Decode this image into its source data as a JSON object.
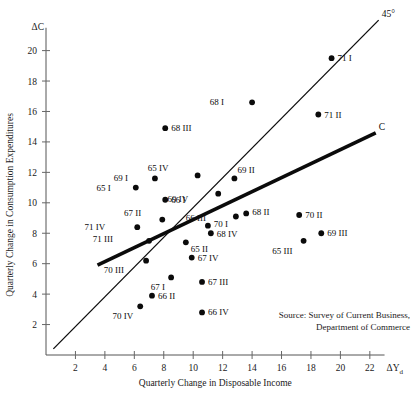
{
  "chart_data": {
    "type": "scatter",
    "title": "",
    "xlabel": "Quarterly Change in Disposable Income",
    "ylabel": "Quarterly Change in Consumption Expenditures",
    "x_symbol": "ΔY",
    "x_symbol_sub": "d",
    "y_symbol": "ΔC",
    "xlim": [
      0,
      23
    ],
    "ylim": [
      0,
      21.5
    ],
    "xticks": [
      2,
      4,
      6,
      8,
      10,
      12,
      14,
      16,
      18,
      20,
      22
    ],
    "yticks": [
      2,
      4,
      6,
      8,
      10,
      12,
      14,
      16,
      18,
      20
    ],
    "grid": false,
    "legend": "none",
    "series": [
      {
        "name": "Quarterly observations",
        "marker": "filled-circle",
        "color": "#0b0b0b",
        "points": [
          {
            "label": "68 III",
            "x": 8.1,
            "y": 14.9,
            "lx": 6,
            "ly": 3
          },
          {
            "label": "71 I",
            "x": 19.4,
            "y": 19.5,
            "lx": 6,
            "ly": 3
          },
          {
            "label": "68 I",
            "x": 14.0,
            "y": 16.6,
            "lx": -28,
            "ly": 3
          },
          {
            "label": "71 II",
            "x": 18.5,
            "y": 15.8,
            "lx": 6,
            "ly": 3
          },
          {
            "label": "69 I",
            "x": 7.4,
            "y": 11.6,
            "lx": -27,
            "ly": 3
          },
          {
            "label": "65 I",
            "x": 6.1,
            "y": 11.0,
            "lx": -25,
            "ly": 3
          },
          {
            "label": "65 IV",
            "x": 10.3,
            "y": 11.8,
            "lx": -29,
            "ly": -4
          },
          {
            "label": "69 II",
            "x": 12.8,
            "y": 11.6,
            "lx": 3,
            "ly": -5
          },
          {
            "label": "66 I",
            "x": 8.1,
            "y": 10.2,
            "lx": 6,
            "ly": 3
          },
          {
            "label": "69 IV",
            "x": 11.7,
            "y": 10.6,
            "lx": -30,
            "ly": 8
          },
          {
            "label": "67 II",
            "x": 7.9,
            "y": 8.9,
            "lx": -21,
            "ly": -4
          },
          {
            "label": "68 II",
            "x": 13.6,
            "y": 9.3,
            "lx": 6,
            "ly": 2
          },
          {
            "label": "70 I",
            "x": 12.9,
            "y": 9.1,
            "lx": -8,
            "ly": 11
          },
          {
            "label": "70 II",
            "x": 17.2,
            "y": 9.2,
            "lx": 6,
            "ly": 3
          },
          {
            "label": "71 IV",
            "x": 6.2,
            "y": 8.4,
            "lx": -32,
            "ly": 3
          },
          {
            "label": "66 III",
            "x": 11.0,
            "y": 8.5,
            "lx": -2,
            "ly": -5
          },
          {
            "label": "68 IV",
            "x": 11.2,
            "y": 8.0,
            "lx": 6,
            "ly": 4
          },
          {
            "label": "71 III",
            "x": 7.0,
            "y": 7.5,
            "lx": -36,
            "ly": 1
          },
          {
            "label": "69 III",
            "x": 18.7,
            "y": 8.0,
            "lx": 6,
            "ly": 3
          },
          {
            "label": "65 II",
            "x": 9.5,
            "y": 7.4,
            "lx": 5,
            "ly": 10
          },
          {
            "label": "65 III",
            "x": 17.5,
            "y": 7.5,
            "lx": -11,
            "ly": 13
          },
          {
            "label": "70 III",
            "x": 6.8,
            "y": 6.2,
            "lx": -22,
            "ly": 12
          },
          {
            "label": "67 IV",
            "x": 9.9,
            "y": 6.4,
            "lx": 6,
            "ly": 3
          },
          {
            "label": "67 I",
            "x": 8.5,
            "y": 5.1,
            "lx": -6,
            "ly": 13
          },
          {
            "label": "67 III",
            "x": 10.6,
            "y": 4.8,
            "lx": 6,
            "ly": 3
          },
          {
            "label": "66 II",
            "x": 7.2,
            "y": 3.9,
            "lx": 6,
            "ly": 3
          },
          {
            "label": "70 IV",
            "x": 6.4,
            "y": 3.2,
            "lx": -7,
            "ly": 13
          },
          {
            "label": "66 IV",
            "x": 10.6,
            "y": 2.8,
            "lx": 6,
            "ly": 3
          }
        ]
      }
    ],
    "lines": [
      {
        "name": "45-degree-line",
        "label": "45°",
        "x1": 0.5,
        "y1": 0.4,
        "x2": 22.6,
        "y2": 22.0,
        "style": "thin"
      },
      {
        "name": "consumption-function-line",
        "label": "C",
        "x1": 3.5,
        "y1": 5.9,
        "x2": 22.4,
        "y2": 14.6,
        "style": "thick"
      }
    ],
    "source_note": {
      "line1": "Source: Survey of Current Business,",
      "line2": "Department of Commerce"
    }
  }
}
